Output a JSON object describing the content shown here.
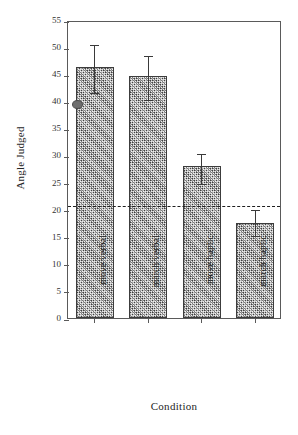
{
  "chart_data": {
    "type": "bar",
    "title": "",
    "xlabel": "Condition",
    "ylabel": "Angle Judged",
    "categories": [
      "move verbal",
      "march verbal",
      "move haptic",
      "march haptic"
    ],
    "values": [
      46.3,
      44.7,
      28.0,
      17.6
    ],
    "error_upper": [
      50.7,
      48.7,
      30.6,
      20.3
    ],
    "error_lower": [
      41.7,
      40.4,
      24.9,
      15.3
    ],
    "ylim": [
      0,
      55
    ],
    "yticks": [
      0,
      5,
      10,
      15,
      20,
      25,
      30,
      35,
      40,
      45,
      50,
      55
    ],
    "ytick_labels": [
      "0",
      "5",
      "10",
      "15",
      "20",
      "25",
      "30",
      "35",
      "40",
      "45",
      "50",
      "55"
    ],
    "grid": false,
    "legend": "none",
    "annotations": [
      {
        "name": "reference-line",
        "kind": "horizontal-dashed-line",
        "value": 21,
        "label": ""
      },
      {
        "name": "reference-dot",
        "kind": "point-marker",
        "value": 40,
        "category_index": 0,
        "label": ""
      }
    ],
    "bar_fill": "#e9e9e9",
    "bar_edge": "#3c3c3c",
    "marker_color": "#6e6e6e",
    "axis_color": "#5a5a5a"
  },
  "axes": {
    "y_title": "Angle Judged",
    "x_title": "Condition"
  },
  "ticks": {
    "y": [
      "55",
      "50",
      "45",
      "40",
      "35",
      "30",
      "25",
      "20",
      "15",
      "10",
      "5",
      "0"
    ],
    "x": [
      "move verbal",
      "march verbal",
      "move haptic",
      "march haptic"
    ]
  }
}
